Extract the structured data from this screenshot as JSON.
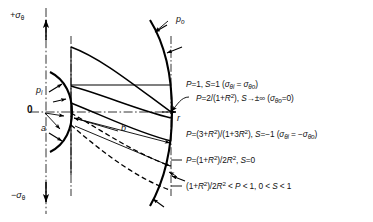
{
  "figure": {
    "type": "engineering-stress-distribution-diagram",
    "axes": {
      "y_positive_label": "+σ",
      "y_positive_sub": "θ",
      "y_negative_label": "−σ",
      "y_negative_sub": "θ",
      "x_label": "r",
      "origin_label": "0"
    },
    "geometry_labels": {
      "inner_pressure": "p",
      "inner_pressure_sub": "i",
      "outer_pressure": "p",
      "outer_pressure_sub": "o",
      "inner_radius": "a",
      "outer_radius": "b"
    },
    "curve_labels": [
      {
        "id": "curve-1",
        "text_plain": "P=1, S=1 (σθi = σθo)",
        "P": "P = 1",
        "S": "S = 1",
        "condition": "σθi = σθo",
        "style": "solid"
      },
      {
        "id": "curve-2",
        "text_plain": "P=2/(1+R²), S→±∞ (σθo=0)",
        "P": "P = 2/(1+R²)",
        "S": "S → ±∞",
        "condition": "σθo = 0",
        "style": "solid"
      },
      {
        "id": "curve-3",
        "text_plain": "P=(3+R²)/(1+3R²), S=−1 (σθi = −σθo)",
        "P": "P = (3+R²)/(1+3R²)",
        "S": "S = −1",
        "condition": "σθi = −σθo",
        "style": "solid"
      },
      {
        "id": "curve-4",
        "text_plain": "P=(1+R²)/2R², S=0",
        "P": "P = (1+R²)/2R²",
        "S": "S = 0",
        "condition": "",
        "style": "dashed"
      },
      {
        "id": "curve-5",
        "text_plain": "(1+R²)/2R² < P < 1, 0 < S < 1",
        "P": "(1+R²)/2R² < P < 1",
        "S": "0 < S < 1",
        "condition": "",
        "style": "dashed"
      }
    ],
    "colors": {
      "line": "#000000",
      "background": "#ffffff"
    }
  }
}
